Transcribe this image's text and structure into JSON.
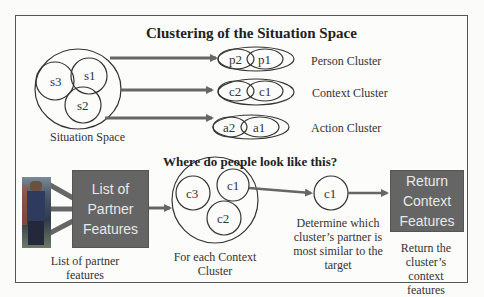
{
  "top_section": {
    "title": "Clustering of the Situation Space",
    "situation_space": {
      "label": "Situation Space",
      "subclusters": [
        "s3",
        "s1",
        "s2"
      ]
    },
    "clusters": [
      {
        "name": "Person Cluster",
        "items": [
          "p2",
          "p1"
        ]
      },
      {
        "name": "Context Cluster",
        "items": [
          "c2",
          "c1"
        ]
      },
      {
        "name": "Action Cluster",
        "items": [
          "a2",
          "a1"
        ]
      }
    ]
  },
  "bottom_section": {
    "title": "Where do people look like this?",
    "photo_caption": "List of partner features",
    "partner_box": "List of Partner Features",
    "context_clusters": {
      "items": [
        "c3",
        "c1",
        "c2"
      ],
      "caption": "For each Context Cluster"
    },
    "selected_cluster": {
      "item": "c1",
      "caption": "Determine which cluster’s partner is most similar to the target"
    },
    "return_box": "Return Context Features",
    "return_caption": "Return the cluster’s context features"
  },
  "colors": {
    "box_fill": "#656565",
    "box_text": "#e8e8e8",
    "arrow": "#666666",
    "stroke": "#333333"
  }
}
